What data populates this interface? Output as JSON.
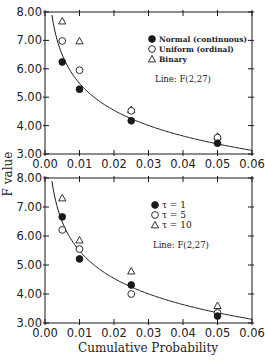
{
  "chart_data": [
    {
      "type": "scatter",
      "panel": "top",
      "title": "",
      "xlabel": "",
      "ylabel": "F value",
      "xlim": [
        0.0,
        0.06
      ],
      "ylim": [
        3.0,
        8.0
      ],
      "xticks": [
        "0.00",
        "0.01",
        "0.02",
        "0.03",
        "0.04",
        "0.05",
        "0.06"
      ],
      "yticks": [
        "3.00",
        "4.00",
        "5.00",
        "6.00",
        "7.00",
        "8.00"
      ],
      "grid": false,
      "legend_position": "upper right",
      "x": [
        0.005,
        0.01,
        0.025,
        0.05
      ],
      "series": [
        {
          "name": "Normal (continuous)",
          "marker": "filled-circle",
          "values": [
            6.24,
            5.28,
            4.17,
            3.38
          ]
        },
        {
          "name": "Uniform (ordinal)",
          "marker": "open-circle",
          "values": [
            6.98,
            5.95,
            4.52,
            3.58
          ]
        },
        {
          "name": "Binary",
          "marker": "open-triangle",
          "values": [
            7.68,
            6.98,
            4.56,
            3.62
          ]
        }
      ],
      "reference_line": {
        "label": "Line: F(2,27)",
        "df1": 2,
        "df2": 27,
        "x_start": 0.002
      }
    },
    {
      "type": "scatter",
      "panel": "bottom",
      "title": "",
      "xlabel": "Cumulative Probability",
      "ylabel": "F value",
      "xlim": [
        0.0,
        0.06
      ],
      "ylim": [
        3.0,
        8.0
      ],
      "xticks": [
        "0.00",
        "0.01",
        "0.02",
        "0.03",
        "0.04",
        "0.05",
        "0.06"
      ],
      "yticks": [
        "3.00",
        "4.00",
        "5.00",
        "6.00",
        "7.00",
        "8.00"
      ],
      "grid": false,
      "legend_position": "upper right",
      "x": [
        0.005,
        0.01,
        0.025,
        0.05
      ],
      "series": [
        {
          "name": "τ = 1",
          "marker": "filled-circle",
          "values": [
            6.66,
            5.21,
            4.31,
            3.24
          ]
        },
        {
          "name": "τ = 5",
          "marker": "open-circle",
          "values": [
            6.21,
            5.55,
            4.0,
            3.35
          ]
        },
        {
          "name": "τ = 10",
          "marker": "open-triangle",
          "values": [
            7.31,
            5.86,
            4.79,
            3.6
          ]
        }
      ],
      "reference_line": {
        "label": "Line: F(2,27)",
        "df1": 2,
        "df2": 27,
        "x_start": 0.002
      }
    }
  ],
  "labels": {
    "y_axis_title": "F value",
    "x_axis_title": "Cumulative Probability",
    "top_line_note": "Line: F(2,27)",
    "bottom_line_note": "Line: F(2,27)"
  },
  "colors": {
    "ink": "#1a1a1a",
    "background": "#ffffff"
  }
}
